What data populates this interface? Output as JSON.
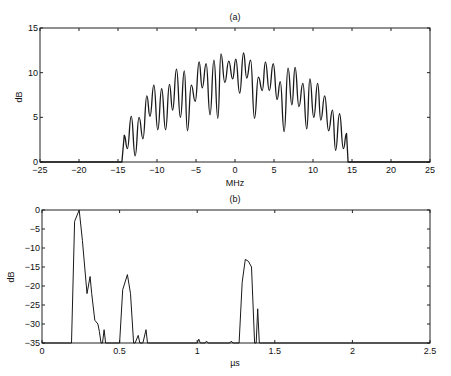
{
  "chart_data": [
    {
      "id": "a",
      "type": "line",
      "title": "(a)",
      "xlabel": "MHz",
      "ylabel": "dB",
      "xlim": [
        -25,
        25
      ],
      "ylim": [
        0,
        15
      ],
      "xticks": [
        -25,
        -20,
        -15,
        -10,
        -5,
        0,
        5,
        10,
        15,
        20,
        25
      ],
      "yticks": [
        0,
        5,
        10,
        15
      ],
      "grid": false,
      "legend": null,
      "description": "Oscillating magnitude spectrum between about -14.5 and 14.5 MHz with a dome-shaped envelope peaking near 12 dB around 0 MHz; zero outside the band.",
      "peaks_x": [
        -14.2,
        -13.3,
        -12.3,
        -11.3,
        -10.4,
        -9.4,
        -8.4,
        -7.5,
        -6.5,
        -5.6,
        -4.6,
        -3.7,
        -2.7,
        -1.8,
        -0.8,
        0.1,
        1.1,
        2.0,
        3.0,
        3.9,
        4.9,
        5.8,
        6.8,
        7.7,
        8.7,
        9.6,
        10.6,
        11.5,
        12.5,
        13.4,
        14.3
      ],
      "peaks_y": [
        3.0,
        5.1,
        5.0,
        7.4,
        8.6,
        8.2,
        8.7,
        10.4,
        10.2,
        8.6,
        11.2,
        11.0,
        11.4,
        12.1,
        11.3,
        11.5,
        12.2,
        11.4,
        9.5,
        11.2,
        11.0,
        9.0,
        10.5,
        10.6,
        8.8,
        9.3,
        8.8,
        7.4,
        5.8,
        5.4,
        3.2
      ],
      "troughs_x": [
        -13.8,
        -12.8,
        -11.8,
        -10.9,
        -9.9,
        -8.9,
        -8.0,
        -7.0,
        -6.1,
        -5.1,
        -4.2,
        -3.2,
        -2.2,
        -1.3,
        -0.3,
        0.6,
        1.5,
        2.5,
        3.5,
        4.4,
        5.4,
        6.3,
        7.3,
        8.2,
        9.2,
        10.1,
        11.0,
        12.0,
        12.9,
        13.9
      ],
      "troughs_y": [
        1.5,
        0.7,
        2.6,
        5.1,
        3.6,
        3.6,
        5.8,
        5.0,
        3.5,
        6.8,
        8.3,
        5.3,
        4.9,
        8.9,
        9.3,
        7.7,
        9.4,
        4.9,
        8.0,
        8.0,
        7.0,
        3.4,
        6.4,
        6.2,
        3.7,
        5.0,
        4.7,
        3.5,
        1.3,
        1.5
      ],
      "band_edges": [
        -14.5,
        14.5
      ]
    },
    {
      "id": "b",
      "type": "line",
      "title": "(b)",
      "xlabel": "µs",
      "ylabel": "dB",
      "xlim": [
        0,
        2.5
      ],
      "ylim": [
        -35,
        0
      ],
      "xticks": [
        0,
        0.5,
        1,
        1.5,
        2,
        2.5
      ],
      "yticks": [
        0,
        -5,
        -10,
        -15,
        -20,
        -25,
        -30,
        -35
      ],
      "grid": false,
      "legend": null,
      "description": "Time-domain response (dB) with main peak at 0 dB near 0.24 µs, secondary peak about -17 dB near 0.55 µs, and a third peak about -12.5 dB near 1.32 µs; clipped at -35 dB floor.",
      "x": [
        0,
        0.19,
        0.21,
        0.24,
        0.26,
        0.29,
        0.31,
        0.32,
        0.34,
        0.36,
        0.37,
        0.38,
        0.39,
        0.4,
        0.41,
        0.5,
        0.52,
        0.55,
        0.57,
        0.59,
        0.6,
        0.62,
        0.63,
        0.65,
        0.67,
        0.68,
        0.69,
        1.0,
        1.01,
        1.02,
        1.05,
        1.06,
        1.07,
        1.21,
        1.22,
        1.23,
        1.27,
        1.29,
        1.31,
        1.33,
        1.35,
        1.37,
        1.38,
        1.39,
        1.4,
        2.5
      ],
      "y": [
        -35,
        -35,
        -3,
        0,
        -8,
        -22,
        -17.5,
        -22,
        -29,
        -30,
        -32,
        -35,
        -35,
        -31.5,
        -35,
        -35,
        -21,
        -17,
        -22,
        -35,
        -35,
        -33,
        -35,
        -35,
        -31.5,
        -35,
        -35,
        -35,
        -34,
        -35,
        -35,
        -34.5,
        -35,
        -35,
        -34.5,
        -35,
        -35,
        -19,
        -13,
        -13.5,
        -15,
        -35,
        -35,
        -26,
        -35,
        -35
      ]
    }
  ]
}
